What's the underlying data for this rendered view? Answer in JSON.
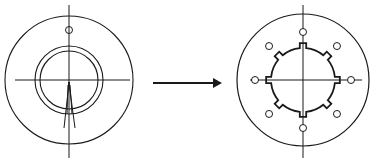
{
  "diagram": {
    "type": "before-after-transformation",
    "stroke_color": "#1a1a1a",
    "background": "#ffffff",
    "left_figure": {
      "name": "circular-disc-with-ring",
      "center": [
        69,
        80
      ],
      "outer_radius": 64,
      "ring_outer_radius": 34,
      "ring_inner_radius": 29,
      "small_hole": {
        "center": [
          69,
          30
        ],
        "radius": 3.5
      },
      "axis_vertical": {
        "y1": 5,
        "y2": 158
      },
      "axis_horizontal": {
        "x1": 15,
        "x2": 130
      }
    },
    "arrow": {
      "x1": 153,
      "x2": 222,
      "y": 83,
      "direction": "right"
    },
    "right_figure": {
      "name": "disc-with-splined-hole",
      "center": [
        303,
        80
      ],
      "outer_radius": 66,
      "spline_radius": 32,
      "notch_count": 8,
      "notch_depth": 5,
      "hole_count": 8,
      "hole_pitch_radius": 48,
      "hole_radius": 3.5,
      "axis_vertical": {
        "y1": 5,
        "y2": 158
      },
      "axis_horizontal": {
        "x1": 250,
        "x2": 362
      }
    }
  }
}
